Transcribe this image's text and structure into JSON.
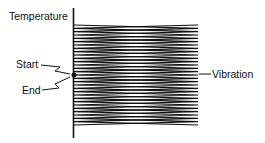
{
  "diagram": {
    "axis_label": "Temperature",
    "start_label": "Start",
    "end_label": "End",
    "vibration_label": "Vibration",
    "line_color": "#111111",
    "zigzag": {
      "x_left": 74,
      "x_right": 198,
      "y_top": 25,
      "y_bottom": 125,
      "passes": 30
    }
  }
}
